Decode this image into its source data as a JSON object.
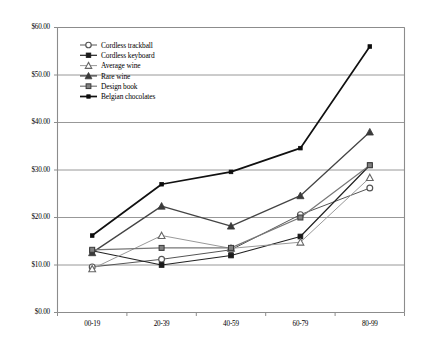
{
  "chart_data": {
    "type": "line",
    "title": "",
    "xlabel": "",
    "ylabel": "",
    "categories": [
      "00-19",
      "20-39",
      "40-59",
      "60-79",
      "80-99"
    ],
    "ylim": [
      0,
      60
    ],
    "ytick_values": [
      0,
      10,
      20,
      30,
      40,
      50,
      60
    ],
    "ytick_labels": [
      "$0.00",
      "$10.00",
      "$20.00",
      "$30.00",
      "$40.00",
      "$50.00",
      "$60.00"
    ],
    "grid": "horizontal",
    "legend_position": "upper-left-inside",
    "series": [
      {
        "name": "Cordless trackball",
        "marker": "open-circle",
        "color": "#555555",
        "values": [
          9.6,
          11.2,
          13.2,
          20.6,
          26.2
        ]
      },
      {
        "name": "Cordless keyboard",
        "marker": "filled-square",
        "color": "#222222",
        "values": [
          13.0,
          10.0,
          12.0,
          16.0,
          31.0
        ]
      },
      {
        "name": "Average wine",
        "marker": "open-triangle",
        "color": "#999999",
        "values": [
          9.2,
          16.2,
          13.5,
          14.8,
          28.4
        ]
      },
      {
        "name": "Rare wine",
        "marker": "filled-triangle",
        "color": "#444444",
        "values": [
          12.6,
          22.4,
          18.2,
          24.6,
          38.0
        ]
      },
      {
        "name": "Design book",
        "marker": "gray-square",
        "color": "#777777",
        "values": [
          13.2,
          13.6,
          13.6,
          20.0,
          31.0
        ]
      },
      {
        "name": "Belgian chocolates",
        "marker": "small-square",
        "color": "#111111",
        "values": [
          16.2,
          27.0,
          29.6,
          34.6,
          56.0
        ]
      }
    ]
  },
  "legend": {
    "items": [
      {
        "label": "Cordless trackball"
      },
      {
        "label": "Cordless keyboard"
      },
      {
        "label": "Average wine"
      },
      {
        "label": "Rare wine"
      },
      {
        "label": "Design book"
      },
      {
        "label": "Belgian chocolates"
      }
    ]
  }
}
